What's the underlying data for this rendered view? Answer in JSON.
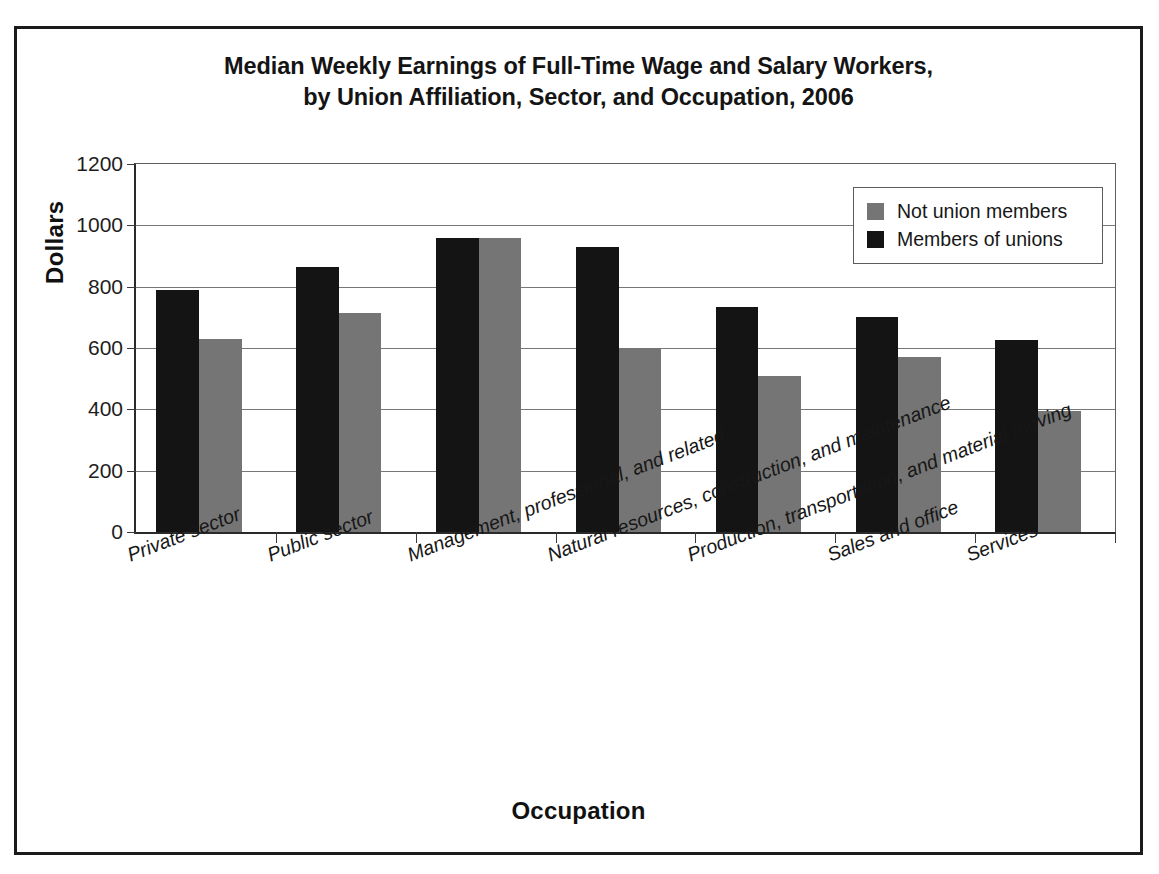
{
  "chart_data": {
    "type": "bar",
    "title": "Median Weekly Earnings of Full-Time Wage and Salary Workers, by Union Affiliation, Sector, and Occupation, 2006",
    "title_lines": [
      "Median Weekly Earnings of Full-Time Wage and Salary Workers,",
      "by Union Affiliation, Sector, and Occupation, 2006"
    ],
    "xlabel": "Occupation",
    "ylabel": "Dollars",
    "ylim": [
      0,
      1200
    ],
    "ytick_step": 200,
    "yticks": [
      0,
      200,
      400,
      600,
      800,
      1000,
      1200
    ],
    "ytick_labels": [
      "0",
      "200",
      "400",
      "600",
      "800",
      "1000",
      "1200"
    ],
    "grid": true,
    "legend_position": "top-right",
    "categories": [
      "Private sector",
      "Public sector",
      "Management, professional, and related",
      "Natural resources, construction, and maintenance",
      "Production, transportation, and material moving",
      "Sales and office",
      "Services"
    ],
    "series": [
      {
        "name": "Members of unions",
        "color": "#141414",
        "values": [
          790,
          865,
          960,
          930,
          735,
          700,
          625
        ]
      },
      {
        "name": "Not union members",
        "color": "#757575",
        "values": [
          630,
          715,
          960,
          600,
          510,
          570,
          395
        ]
      }
    ]
  },
  "legend": {
    "items": [
      {
        "label": "Not union members",
        "swatch": "nonunion"
      },
      {
        "label": "Members of unions",
        "swatch": "union"
      }
    ]
  }
}
